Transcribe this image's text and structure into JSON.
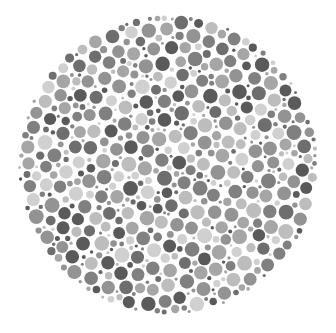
{
  "image": {
    "subject": "Ishihara-style color vision test plate (grayscale)",
    "description": "Circular plate filled with densely packed dots of varying size and gray tone",
    "palette": [
      "#5a5a5a",
      "#6e6e6e",
      "#808080",
      "#939393",
      "#a6a6a6",
      "#bdbdbd",
      "#d0d0d0"
    ],
    "background_color": "#ffffff",
    "hidden_figure_visible": false
  }
}
